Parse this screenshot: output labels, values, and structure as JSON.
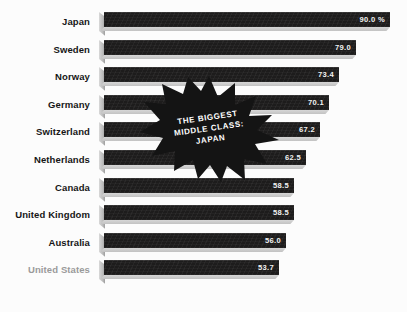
{
  "chart_data": {
    "type": "bar",
    "title": "",
    "xlabel": "",
    "ylabel": "",
    "orientation": "horizontal",
    "unit": "%",
    "grid": false,
    "legend": "none",
    "xlim": [
      0,
      90
    ],
    "categories": [
      "Japan",
      "Sweden",
      "Norway",
      "Germany",
      "Switzerland",
      "Netherlands",
      "Canada",
      "United Kingdom",
      "Australia",
      "United States"
    ],
    "values": [
      90.0,
      79.0,
      73.4,
      70.1,
      67.2,
      62.5,
      58.5,
      58.5,
      56.0,
      53.7
    ],
    "value_labels": [
      "90.0 %",
      "79.0",
      "73.4",
      "70.1",
      "67.2",
      "62.5",
      "58.5",
      "58.5",
      "56.0",
      "53.7"
    ],
    "highlight_category": "United States",
    "annotation": {
      "shape": "starburst",
      "lines": [
        "THE BIGGEST",
        "MIDDLE CLASS:",
        "JAPAN"
      ]
    }
  },
  "colors": {
    "background": "#fcfcfc",
    "bar": "#1d1c1c",
    "bar_3d_edge": "#c2c2c2",
    "label": "#161616",
    "label_muted": "#9a9a9a",
    "value_text": "#f2f2f2",
    "badge": "#141414",
    "badge_text": "#ffffff"
  },
  "rows": [
    {
      "label": "Japan",
      "value_label": "90.0 %",
      "bar_px": 286,
      "muted": false
    },
    {
      "label": "Sweden",
      "value_label": "79.0",
      "bar_px": 252,
      "muted": false
    },
    {
      "label": "Norway",
      "value_label": "73.4",
      "bar_px": 235,
      "muted": false
    },
    {
      "label": "Germany",
      "value_label": "70.1",
      "bar_px": 225,
      "muted": false
    },
    {
      "label": "Switzerland",
      "value_label": "67.2",
      "bar_px": 216,
      "muted": false
    },
    {
      "label": "Netherlands",
      "value_label": "62.5",
      "bar_px": 202,
      "muted": false
    },
    {
      "label": "Canada",
      "value_label": "58.5",
      "bar_px": 190,
      "muted": false
    },
    {
      "label": "United Kingdom",
      "value_label": "58.5",
      "bar_px": 190,
      "muted": false
    },
    {
      "label": "Australia",
      "value_label": "56.0",
      "bar_px": 182,
      "muted": false
    },
    {
      "label": "United States",
      "value_label": "53.7",
      "bar_px": 175,
      "muted": true
    }
  ],
  "badge": {
    "line1": "THE BIGGEST",
    "line2": "MIDDLE CLASS:",
    "line3": "JAPAN"
  }
}
